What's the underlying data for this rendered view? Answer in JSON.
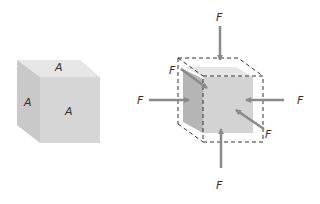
{
  "left_cube": {
    "face_labels": {
      "top": "A",
      "left": "A",
      "front": "A"
    },
    "colors": {
      "top": "#e6e6e6",
      "left": "#c9c9c9",
      "front": "#d6d6d6"
    }
  },
  "right_cube": {
    "force_labels": {
      "top": "F",
      "bottom": "F",
      "left": "F",
      "right": "F",
      "back_upper_left": "F",
      "front_lower_right": "F"
    },
    "colors": {
      "arrow": "#8a8a8a",
      "dashed": "#333333",
      "top": "#e6e6e6",
      "left": "#b5b5b5",
      "front": "#d3d3d3"
    }
  }
}
